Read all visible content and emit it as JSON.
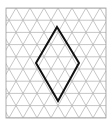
{
  "diagram": {
    "type": "isometric-grid-with-rhombus",
    "grid": {
      "x0": 6,
      "y0": 8,
      "x1": 106,
      "y1": 118,
      "cell_width": 14,
      "row_height": 12.2,
      "rows": 9,
      "line_color": "#b8b8b8",
      "border_color": "#9a9a9a"
    },
    "shape": {
      "name": "rhombus",
      "vertices": [
        [
          57,
          27
        ],
        [
          79,
          63
        ],
        [
          58,
          101
        ],
        [
          36,
          63
        ]
      ],
      "stroke_color": "#111111",
      "stroke_width": 2
    }
  }
}
